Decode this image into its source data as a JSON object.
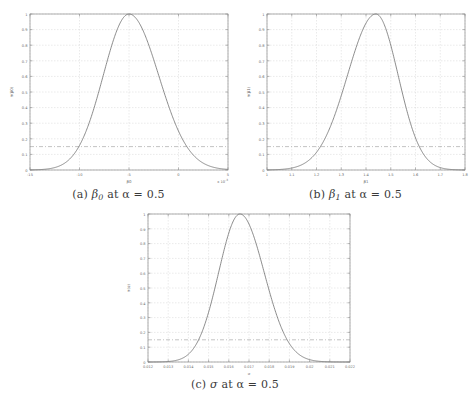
{
  "figure": {
    "background_color": "#ffffff",
    "axis_color": "#8a8a8a",
    "grid_color": "#d4d4d4",
    "curve_color": "#6e6e6e",
    "threshold_color": "#9a9a9a",
    "tick_label_color": "#6a6a6a"
  },
  "panels": [
    {
      "key": "a",
      "caption_prefix": "(a)",
      "caption_symbol": "β",
      "caption_subscript": "0",
      "caption_rest": "at α = 0.5",
      "caption_full": "(a) β0 at α = 0.5",
      "ylabel": "π(β0)",
      "xlabel": "β0",
      "x_multiplier": "x 10",
      "x_multiplier_exp": "-3",
      "xticks": [
        "-15",
        "-10",
        "-5",
        "0",
        "5"
      ],
      "xtick_values": [
        -15,
        -10,
        -5,
        0,
        5
      ],
      "yticks": [
        "0",
        "0.1",
        "0.2",
        "0.3",
        "0.4",
        "0.5",
        "0.6",
        "0.7",
        "0.8",
        "0.9",
        "1"
      ],
      "ytick_values": [
        0,
        0.1,
        0.2,
        0.3,
        0.4,
        0.5,
        0.6,
        0.7,
        0.8,
        0.9,
        1
      ],
      "threshold": 0.15
    },
    {
      "key": "b",
      "caption_prefix": "(b)",
      "caption_symbol": "β",
      "caption_subscript": "1",
      "caption_rest": "at α = 0.5",
      "caption_full": "(b) β1 at α = 0.5",
      "ylabel": "π(β1)",
      "xlabel": "β1",
      "x_multiplier": "",
      "x_multiplier_exp": "",
      "xticks": [
        "1",
        "1.1",
        "1.2",
        "1.3",
        "1.4",
        "1.5",
        "1.6",
        "1.7",
        "1.8"
      ],
      "xtick_values": [
        1,
        1.1,
        1.2,
        1.3,
        1.4,
        1.5,
        1.6,
        1.7,
        1.8
      ],
      "yticks": [
        "0",
        "0.1",
        "0.2",
        "0.3",
        "0.4",
        "0.5",
        "0.6",
        "0.7",
        "0.8",
        "0.9",
        "1"
      ],
      "ytick_values": [
        0,
        0.1,
        0.2,
        0.3,
        0.4,
        0.5,
        0.6,
        0.7,
        0.8,
        0.9,
        1
      ],
      "threshold": 0.15
    },
    {
      "key": "c",
      "caption_prefix": "(c)",
      "caption_symbol": "σ",
      "caption_subscript": "",
      "caption_rest": "at α = 0.5",
      "caption_full": "(c) σ at α = 0.5",
      "ylabel": "π(σ)",
      "xlabel": "σ",
      "x_multiplier": "",
      "x_multiplier_exp": "",
      "xticks": [
        "0.012",
        "0.013",
        "0.014",
        "0.015",
        "0.016",
        "0.017",
        "0.018",
        "0.019",
        "0.02",
        "0.021",
        "0.022"
      ],
      "xtick_values": [
        0.012,
        0.013,
        0.014,
        0.015,
        0.016,
        0.017,
        0.018,
        0.019,
        0.02,
        0.021,
        0.022
      ],
      "yticks": [
        "0",
        "0.1",
        "0.2",
        "0.3",
        "0.4",
        "0.5",
        "0.6",
        "0.7",
        "0.8",
        "0.9",
        "1"
      ],
      "ytick_values": [
        0,
        0.1,
        0.2,
        0.3,
        0.4,
        0.5,
        0.6,
        0.7,
        0.8,
        0.9,
        1
      ],
      "threshold": 0.15
    }
  ],
  "chart_data": [
    {
      "type": "line",
      "title": "(a) β0 at α = 0.5",
      "xlabel": "β0",
      "ylabel": "π(β0)",
      "x_scale_multiplier": 0.001,
      "xlim": [
        -15,
        5
      ],
      "ylim": [
        0,
        1
      ],
      "grid": true,
      "legend": "none",
      "peak_x": -5.0,
      "peak_y": 1.0,
      "sigma": 2.6,
      "skew_left_sigma": 2.6,
      "skew_right_sigma": 3.0,
      "threshold_line": 0.15,
      "x": [
        -15,
        -14,
        -13,
        -12,
        -11,
        -10,
        -9,
        -8,
        -7,
        -6,
        -5,
        -4,
        -3,
        -2,
        -1,
        0,
        1,
        2,
        3,
        4,
        5
      ],
      "y": [
        0.001,
        0.003,
        0.008,
        0.02,
        0.05,
        0.11,
        0.23,
        0.42,
        0.68,
        0.91,
        1.0,
        0.94,
        0.76,
        0.52,
        0.3,
        0.15,
        0.065,
        0.025,
        0.009,
        0.003,
        0.001
      ]
    },
    {
      "type": "line",
      "title": "(b) β1 at α = 0.5",
      "xlabel": "β1",
      "ylabel": "π(β1)",
      "xlim": [
        1.0,
        1.8
      ],
      "ylim": [
        0,
        1
      ],
      "grid": true,
      "legend": "none",
      "peak_x": 1.44,
      "peak_y": 1.0,
      "sigma": 0.105,
      "skew_left_sigma": 0.115,
      "skew_right_sigma": 0.09,
      "threshold_line": 0.15,
      "x": [
        1.0,
        1.05,
        1.1,
        1.15,
        1.2,
        1.25,
        1.3,
        1.35,
        1.4,
        1.44,
        1.5,
        1.55,
        1.6,
        1.65,
        1.7,
        1.75,
        1.8
      ],
      "y": [
        0.004,
        0.012,
        0.03,
        0.07,
        0.14,
        0.26,
        0.45,
        0.7,
        0.94,
        1.0,
        0.83,
        0.55,
        0.28,
        0.11,
        0.035,
        0.009,
        0.002
      ]
    },
    {
      "type": "line",
      "title": "(c) σ at α = 0.5",
      "xlabel": "σ",
      "ylabel": "π(σ)",
      "xlim": [
        0.012,
        0.022
      ],
      "ylim": [
        0,
        1
      ],
      "grid": true,
      "legend": "none",
      "peak_x": 0.01655,
      "peak_y": 1.0,
      "sigma": 0.00105,
      "skew_left_sigma": 0.00105,
      "skew_right_sigma": 0.0012,
      "threshold_line": 0.15,
      "x": [
        0.012,
        0.0125,
        0.013,
        0.0135,
        0.014,
        0.0145,
        0.015,
        0.0155,
        0.016,
        0.01655,
        0.017,
        0.0175,
        0.018,
        0.0185,
        0.019,
        0.0195,
        0.02,
        0.021,
        0.022
      ],
      "y": [
        0.001,
        0.003,
        0.009,
        0.025,
        0.065,
        0.15,
        0.32,
        0.57,
        0.85,
        1.0,
        0.95,
        0.78,
        0.54,
        0.32,
        0.16,
        0.07,
        0.027,
        0.003,
        0.0004
      ]
    }
  ]
}
